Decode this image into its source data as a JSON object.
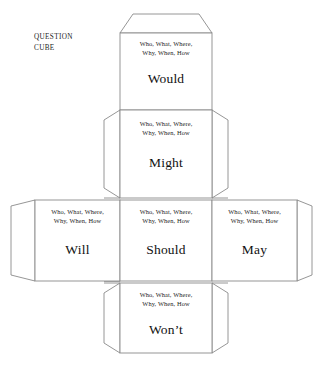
{
  "document": {
    "title_line1": "QUESTION",
    "title_line2": "CUBE"
  },
  "shared": {
    "prompt": "Who, What, Where,\nWhy, When, How"
  },
  "faces": [
    {
      "id": "would",
      "name": "face-would",
      "position": "top",
      "prompt": "Who, What, Where,\nWhy, When, How",
      "word": "Would"
    },
    {
      "id": "might",
      "name": "face-might",
      "position": "upper-middle",
      "prompt": "Who, What, Where,\nWhy, When, How",
      "word": "Might"
    },
    {
      "id": "will",
      "name": "face-will",
      "position": "middle-left",
      "prompt": "Who, What, Where,\nWhy, When, How",
      "word": "Will"
    },
    {
      "id": "should",
      "name": "face-should",
      "position": "middle-center",
      "prompt": "Who, What, Where,\nWhy, When, How",
      "word": "Should"
    },
    {
      "id": "may",
      "name": "face-may",
      "position": "middle-right",
      "prompt": "Who, What, Where,\nWhy, When, How",
      "word": "May"
    },
    {
      "id": "wont",
      "name": "face-wont",
      "position": "bottom",
      "prompt": "Who, What, Where,\nWhy, When, How",
      "word": "Won’t"
    }
  ],
  "colors": {
    "line": "#8a8a8a",
    "text": "#1a1a1a",
    "background": "#ffffff"
  }
}
